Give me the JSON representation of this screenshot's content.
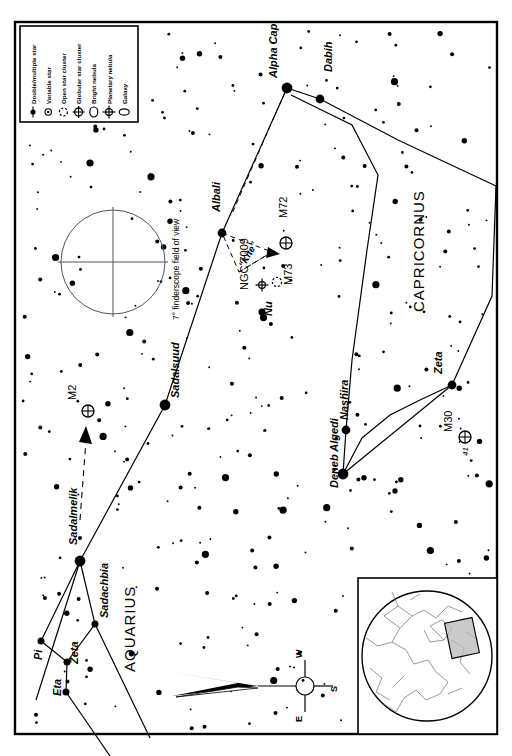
{
  "chart": {
    "frame": {
      "stroke": "#000000",
      "width": 2
    },
    "background": "#ffffff",
    "star_color": "#000000"
  },
  "legend": {
    "title": "",
    "items": [
      {
        "label": "Double/multiple star",
        "symbol": "double-star"
      },
      {
        "label": "Variable star",
        "symbol": "variable-star"
      },
      {
        "label": "Open star cluster",
        "symbol": "open-cluster"
      },
      {
        "label": "Globular star cluster",
        "symbol": "globular-cluster"
      },
      {
        "label": "Bright nebula",
        "symbol": "bright-nebula"
      },
      {
        "label": "Planetary nebula",
        "symbol": "planetary-nebula"
      },
      {
        "label": "Galaxy",
        "symbol": "galaxy"
      }
    ]
  },
  "finder": {
    "label": "7° finderscope field of view",
    "cx": 113,
    "cy": 262,
    "r": 52
  },
  "compass": {
    "top": "W",
    "right": "S",
    "bottom": "E",
    "cx": 305,
    "cy": 686,
    "r": 9
  },
  "constellations": [
    {
      "name": "AQUARIUS",
      "x": 135,
      "y": 665,
      "rotate": -90
    },
    {
      "name": "CAPRICORNUS",
      "x": 424,
      "y": 240,
      "rotate": -90
    }
  ],
  "named_stars": [
    {
      "name": "Alpha Cap",
      "x": 287,
      "y": 88,
      "mag": 1,
      "label_x": 277,
      "label_y": 78,
      "rotate": -90,
      "style": "italic"
    },
    {
      "name": "Dabih",
      "x": 320,
      "y": 99,
      "mag": 2,
      "label_x": 332,
      "label_y": 72,
      "rotate": -90,
      "style": "italic"
    },
    {
      "name": "Albali",
      "x": 222,
      "y": 233,
      "mag": 2,
      "label_x": 220,
      "label_y": 212,
      "rotate": -90,
      "style": "italic"
    },
    {
      "name": "Sadalsuud",
      "x": 165,
      "y": 405,
      "mag": 1,
      "label_x": 179,
      "label_y": 398,
      "rotate": -90,
      "style": "italic"
    },
    {
      "name": "Sadalmelik",
      "x": 80,
      "y": 561,
      "mag": 1,
      "label_x": 77,
      "label_y": 545,
      "rotate": -90,
      "style": "italic"
    },
    {
      "name": "Sadachbia",
      "x": 95,
      "y": 624,
      "mag": 3,
      "label_x": 108,
      "label_y": 618,
      "rotate": -90,
      "style": "italic"
    },
    {
      "name": "Zeta",
      "x": 67,
      "y": 662,
      "mag": 3,
      "label_x": 78,
      "label_y": 664,
      "rotate": -90,
      "style": "italic"
    },
    {
      "name": "Pi",
      "x": 41,
      "y": 641,
      "mag": 3,
      "label_x": 42,
      "label_y": 660,
      "rotate": -90,
      "style": "italic"
    },
    {
      "name": "Eta",
      "x": 66,
      "y": 692,
      "mag": 3,
      "label_x": 61,
      "label_y": 696,
      "rotate": -90,
      "style": "italic"
    },
    {
      "name": "Deneb Algedi",
      "x": 343,
      "y": 474,
      "mag": 1,
      "label_x": 338,
      "label_y": 488,
      "rotate": -90,
      "style": "italic"
    },
    {
      "name": "Nashira",
      "x": 346,
      "y": 430,
      "mag": 2,
      "label_x": 348,
      "label_y": 420,
      "rotate": -90,
      "style": "italic"
    },
    {
      "name": "Zeta",
      "x": 452,
      "y": 385,
      "mag": 2,
      "label_x": 442,
      "label_y": 374,
      "rotate": -90,
      "style": "italic"
    },
    {
      "name": "Nu",
      "x": 262,
      "y": 312,
      "mag": 3,
      "label_x": 272,
      "label_y": 316,
      "rotate": -90,
      "style": "italic"
    }
  ],
  "deep_sky": [
    {
      "name": "M2",
      "type": "globular-cluster",
      "x": 88,
      "y": 411,
      "label_x": 76,
      "label_y": 400,
      "rotate": -90
    },
    {
      "name": "M72",
      "type": "globular-cluster",
      "x": 286,
      "y": 243,
      "label_x": 287,
      "label_y": 218,
      "rotate": -90
    },
    {
      "name": "M73",
      "type": "open-cluster",
      "x": 277,
      "y": 282,
      "label_x": 292,
      "label_y": 285,
      "rotate": -90
    },
    {
      "name": "NGC 7009",
      "type": "planetary-nebula",
      "x": 262,
      "y": 285,
      "label_x": 248,
      "label_y": 290,
      "rotate": -90
    },
    {
      "name": "M30",
      "type": "globular-cluster",
      "x": 465,
      "y": 437,
      "label_x": 452,
      "label_y": 432,
      "rotate": -90
    },
    {
      "name": "41",
      "type": "star-label",
      "x": 470,
      "y": 455,
      "label_x": 468,
      "label_y": 456,
      "rotate": -90
    }
  ],
  "asterisms": [
    {
      "name": "“Kite”",
      "x": 241,
      "y": 248,
      "rotate": -45
    }
  ],
  "inset": {
    "label": "all-sky locator",
    "x": 358,
    "y": 578,
    "w": 148,
    "h": 156,
    "highlight": {
      "x": 450,
      "y": 620,
      "w": 26,
      "h": 34,
      "fill": "#b8b8b8"
    }
  }
}
